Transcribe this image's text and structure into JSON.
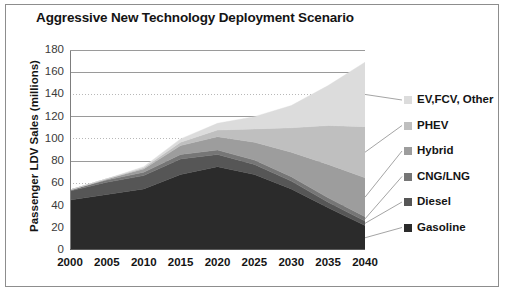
{
  "figure": {
    "border_color": "#8d8d8d",
    "background": "#ffffff"
  },
  "chart_data": {
    "type": "area",
    "stacked": true,
    "title": "Aggressive New Technology Deployment Scenario",
    "subtitle": "",
    "xlabel": "",
    "ylabel": "Passenger LDV Sales (millions)",
    "xlim": [
      2000,
      2040
    ],
    "ylim": [
      0,
      180
    ],
    "ytick_step": 20,
    "grid": true,
    "grid_axis": "y",
    "legend_position": "right",
    "x": [
      2000,
      2005,
      2010,
      2015,
      2020,
      2025,
      2030,
      2035,
      2040
    ],
    "categories": [
      "2000",
      "2005",
      "2010",
      "2015",
      "2020",
      "2025",
      "2030",
      "2035",
      "2040"
    ],
    "xtick_labels": [
      "2000",
      "2005",
      "2010",
      "2015",
      "2020",
      "2025",
      "2030",
      "2035",
      "2040"
    ],
    "ytick_labels": [
      "0",
      "20",
      "40",
      "60",
      "80",
      "100",
      "120",
      "140",
      "160",
      "180"
    ],
    "ytick_values": [
      0,
      20,
      40,
      60,
      80,
      100,
      120,
      140,
      160,
      180
    ],
    "series": [
      {
        "name": "Gasoline",
        "color": "#2b2b2b",
        "values": [
          45,
          50,
          55,
          68,
          75,
          68,
          55,
          38,
          22
        ]
      },
      {
        "name": "Diesel",
        "color": "#565656",
        "values": [
          8,
          11,
          12,
          14,
          11,
          9,
          7,
          5,
          4
        ]
      },
      {
        "name": "CNG/LNG",
        "color": "#767676",
        "values": [
          1,
          2,
          3,
          4,
          4,
          4,
          4,
          4,
          4
        ]
      },
      {
        "name": "Hybrid",
        "color": "#9d9d9d",
        "values": [
          0,
          1,
          3,
          8,
          12,
          16,
          22,
          30,
          35
        ]
      },
      {
        "name": "PHEV",
        "color": "#bfbfbf",
        "values": [
          0,
          0,
          1,
          3,
          6,
          12,
          22,
          35,
          46
        ]
      },
      {
        "name": "EV,FCV, Other",
        "color": "#dcdcdc",
        "values": [
          0,
          0,
          1,
          3,
          6,
          11,
          20,
          36,
          58
        ]
      }
    ],
    "series_order_bottom_to_top": [
      "Gasoline",
      "Diesel",
      "CNG/LNG",
      "Hybrid",
      "PHEV",
      "EV,FCV, Other"
    ],
    "totals": [
      54,
      64,
      75,
      100,
      114,
      120,
      130,
      148,
      169
    ]
  },
  "legend": {
    "entries": [
      {
        "label": "EV,FCV, Other",
        "color": "#dcdcdc"
      },
      {
        "label": "PHEV",
        "color": "#bfbfbf"
      },
      {
        "label": "Hybrid",
        "color": "#9d9d9d"
      },
      {
        "label": "CNG/LNG",
        "color": "#767676"
      },
      {
        "label": "Diesel",
        "color": "#565656"
      },
      {
        "label": "Gasoline",
        "color": "#2b2b2b"
      }
    ]
  }
}
